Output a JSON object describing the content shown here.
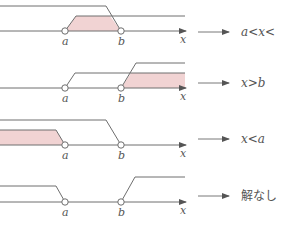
{
  "colors": {
    "line": "#6e6e6e",
    "fill": "#f1d3d3",
    "text": "#555555"
  },
  "points": {
    "a_label": "a",
    "b_label": "b",
    "x_label": "x"
  },
  "panels": [
    {
      "id": "panel-1",
      "result": "a<x<",
      "shaded": "a<x<b"
    },
    {
      "id": "panel-2",
      "result": "x>b",
      "shaded": "x>b"
    },
    {
      "id": "panel-3",
      "result": "x<a",
      "shaded": "x<a"
    },
    {
      "id": "panel-4",
      "result": "解なし",
      "shaded": "none"
    }
  ]
}
